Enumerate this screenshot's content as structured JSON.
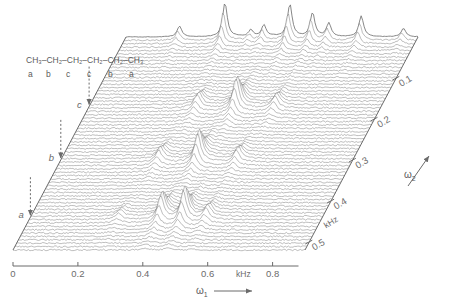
{
  "figure": {
    "kind": "2d-nmr-stacked-plot",
    "sample": "n-hexane",
    "ink_color": "#6b6b6b",
    "background": "#ffffff"
  },
  "structure": {
    "formula_parts": [
      "CH",
      "3",
      "–CH",
      "2",
      "–CH",
      "2",
      "–CH",
      "2",
      "–CH",
      "2",
      "–CH",
      "3"
    ],
    "formula_text": "CH₃–CH₂–CH₂–CH₂–CH₂–CH₃",
    "assignments": [
      "a",
      "b",
      "c",
      "c",
      "b",
      "a"
    ]
  },
  "markers": [
    {
      "label": "a",
      "x_khz": 0.05,
      "omega2_khz": 0.44
    },
    {
      "label": "b",
      "x_khz": 0.16,
      "omega2_khz": 0.3
    },
    {
      "label": "c",
      "x_khz": 0.27,
      "omega2_khz": 0.17
    }
  ],
  "axes": {
    "x": {
      "name": "ω",
      "name_sub": "1",
      "unit": "kHz",
      "unit_label_x_khz": 0.71,
      "ticks": [
        0,
        0.2,
        0.4,
        0.6,
        0.8
      ],
      "tick_labels": [
        "0",
        "0.2",
        "0.4",
        "0.6",
        "0.8"
      ],
      "min": 0,
      "max": 0.9,
      "arrow": true
    },
    "omega2": {
      "name": "ω",
      "name_sub": "2",
      "unit": "kHz",
      "ticks": [
        0.1,
        0.2,
        0.3,
        0.4,
        0.5
      ],
      "tick_labels": [
        "0.1",
        "0.2",
        "0.3",
        "0.4",
        "0.5"
      ],
      "min": 0.0,
      "max": 0.52,
      "arrow": true,
      "direction": "up-right-diagonal"
    }
  },
  "chart_data": {
    "type": "line",
    "title": "",
    "xlabel": "ω₁ (kHz)",
    "ylabel": "ω₂ (kHz)",
    "xlim": [
      0.0,
      0.9
    ],
    "ylim": [
      0.0,
      0.52
    ],
    "grid": false,
    "legend": null,
    "n_traces": 64,
    "trace_spacing_khz": 0.008,
    "projection": {
      "name": "top 1D projection (ω₂ = 0)",
      "peaks_khz": [
        0.165,
        0.305,
        0.385,
        0.425,
        0.505,
        0.575,
        0.625,
        0.725,
        0.855
      ],
      "peak_heights": [
        0.32,
        1.0,
        0.2,
        0.34,
        0.96,
        0.7,
        0.4,
        0.62,
        0.25
      ]
    },
    "series": [
      {
        "name": "row-c",
        "omega2_khz": 0.17,
        "peaks_khz": [
          0.335,
          0.455,
          0.575
        ],
        "peak_heights": [
          0.45,
          1.0,
          0.4
        ]
      },
      {
        "name": "row-b",
        "omega2_khz": 0.3,
        "peaks_khz": [
          0.305,
          0.425,
          0.545
        ],
        "peak_heights": [
          0.42,
          1.0,
          0.4
        ]
      },
      {
        "name": "row-a",
        "omega2_khz": 0.44,
        "peaks_khz": [
          0.275,
          0.405,
          0.475,
          0.545
        ],
        "peak_heights": [
          0.22,
          0.82,
          1.0,
          0.38
        ]
      }
    ]
  }
}
